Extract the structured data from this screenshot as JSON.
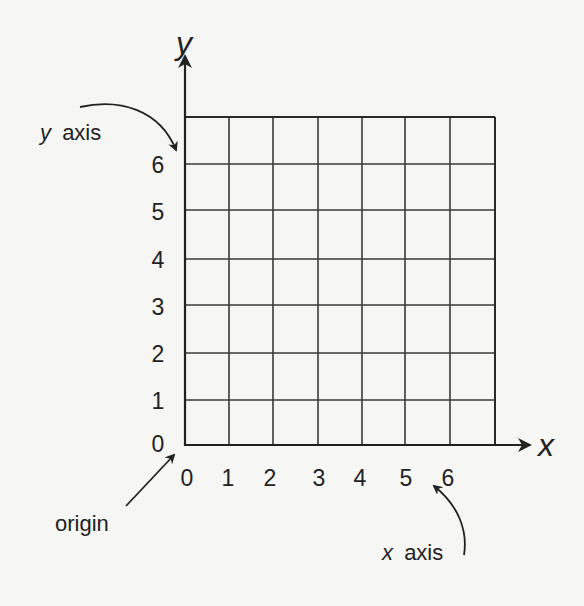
{
  "diagram": {
    "x_axis_variable": "x",
    "y_axis_variable": "y",
    "x_tick_labels": [
      "0",
      "1",
      "2",
      "3",
      "4",
      "5",
      "6"
    ],
    "y_tick_labels": [
      "6",
      "5",
      "4",
      "3",
      "2",
      "1",
      "0"
    ],
    "callouts": {
      "y_axis": {
        "var": "y",
        "text": "axis"
      },
      "x_axis": {
        "var": "x",
        "text": "axis"
      },
      "origin": {
        "text": "origin"
      }
    },
    "grid": {
      "columns": 7,
      "rows": 7
    },
    "colors": {
      "background": "#f6f6f4",
      "ink": "#222222"
    }
  }
}
